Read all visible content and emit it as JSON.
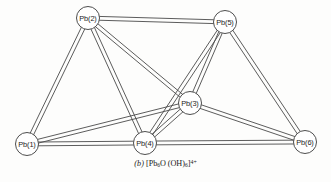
{
  "figure": {
    "kind": "molecular-structure-diagram",
    "caption": {
      "index": "(b)",
      "formula_plain": "[Pb6O(OH)6]4+",
      "bracket_open": "[",
      "element_pb": "Pb",
      "pb_count": "6",
      "element_o": "O",
      "hydroxide_open": "(OH)",
      "hydroxide_count": "6",
      "bracket_close": "]",
      "charge": "4+"
    },
    "colors": {
      "background": "#fdfdfc",
      "bond_stroke": "#4a4a4a",
      "atom_fill": "#ffffff",
      "atom_stroke": "#3a3a3a",
      "label_text": "#1d1d1d"
    },
    "geometry": {
      "width": 331,
      "height": 182,
      "atom_radius": 11.5,
      "bond_gap": 1.9
    }
  },
  "atoms": [
    {
      "id": "pb1",
      "label": "Pb(1)",
      "x": 27,
      "y": 144
    },
    {
      "id": "pb2",
      "label": "Pb(2)",
      "x": 88,
      "y": 18
    },
    {
      "id": "pb3",
      "label": "Pb(3)",
      "x": 190,
      "y": 103
    },
    {
      "id": "pb4",
      "label": "Pb(4)",
      "x": 145,
      "y": 143
    },
    {
      "id": "pb5",
      "label": "Pb(5)",
      "x": 225,
      "y": 22
    },
    {
      "id": "pb6",
      "label": "Pb(6)",
      "x": 305,
      "y": 142
    }
  ],
  "bonds": [
    {
      "id": "b-pb2-pb5",
      "from": "pb2",
      "to": "pb5"
    },
    {
      "id": "b-pb2-pb1",
      "from": "pb2",
      "to": "pb1"
    },
    {
      "id": "b-pb2-pb4",
      "from": "pb2",
      "to": "pb4"
    },
    {
      "id": "b-pb2-pb3",
      "from": "pb2",
      "to": "pb3"
    },
    {
      "id": "b-pb5-pb3",
      "from": "pb5",
      "to": "pb3"
    },
    {
      "id": "b-pb5-pb4",
      "from": "pb5",
      "to": "pb4"
    },
    {
      "id": "b-pb5-pb6",
      "from": "pb5",
      "to": "pb6"
    },
    {
      "id": "b-pb1-pb3",
      "from": "pb1",
      "to": "pb3"
    },
    {
      "id": "b-pb1-pb4",
      "from": "pb1",
      "to": "pb4"
    },
    {
      "id": "b-pb3-pb4",
      "from": "pb3",
      "to": "pb4"
    },
    {
      "id": "b-pb3-pb6",
      "from": "pb3",
      "to": "pb6"
    },
    {
      "id": "b-pb4-pb6",
      "from": "pb4",
      "to": "pb6"
    }
  ]
}
